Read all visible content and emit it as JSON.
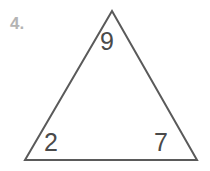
{
  "figure": {
    "problem_number": "4.",
    "shape": "triangle",
    "stroke_color": "#5a5a5a",
    "label_color": "#4a4a4a",
    "number_color": "#b4b4b4",
    "background_color": "#ffffff",
    "vertices": {
      "apex": {
        "x": 112,
        "y": 11
      },
      "bottom_left": {
        "x": 25,
        "y": 160
      },
      "bottom_right": {
        "x": 197,
        "y": 160
      }
    },
    "labels": {
      "top": "9",
      "bottom_left": "2",
      "bottom_right": "7"
    }
  },
  "chart_data": {
    "type": "diagram",
    "title": "",
    "shape": "triangle",
    "annotations": [
      {
        "position": "top-vertex-interior",
        "text": "9"
      },
      {
        "position": "bottom-left-vertex-interior",
        "text": "2"
      },
      {
        "position": "bottom-right-vertex-interior",
        "text": "7"
      },
      {
        "position": "top-left-outside",
        "text": "4."
      }
    ]
  }
}
